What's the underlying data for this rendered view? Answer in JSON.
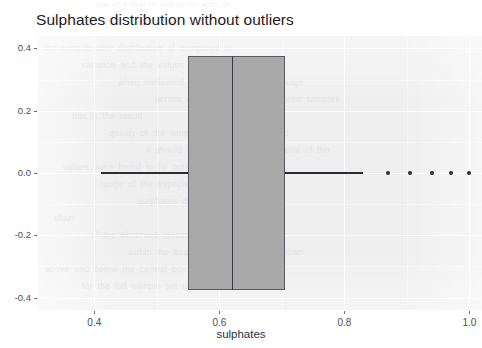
{
  "chart_data": {
    "type": "box",
    "orientation": "horizontal",
    "title": "Sulphates distribution without outliers",
    "xlabel": "sulphates",
    "ylabel": "",
    "xlim": [
      0.31,
      1.02
    ],
    "ylim": [
      -0.44,
      0.44
    ],
    "grid": true,
    "legend": "none",
    "xticks": [
      0.4,
      0.6,
      0.8,
      1.0
    ],
    "xtick_labels": [
      "0.4",
      "0.6",
      "0.8",
      "1.0"
    ],
    "yticks": [
      0.4,
      0.2,
      0.0,
      -0.2,
      -0.4
    ],
    "ytick_labels": [
      "0.4",
      "0.2",
      "0.0",
      "-0.2",
      "-0.4"
    ],
    "series": [
      {
        "name": "sulphates",
        "whisker_low": 0.41,
        "q1": 0.55,
        "median": 0.62,
        "q3": 0.705,
        "whisker_high": 0.83,
        "box_bottom": -0.375,
        "box_top": 0.375,
        "center": 0.0,
        "outliers": [
          0.87,
          0.905,
          0.94,
          0.97,
          1.0
        ]
      }
    ],
    "colors": {
      "panel_background": "#efefef",
      "grid": "#ffffff",
      "box_fill": "#a9a9a9",
      "box_border": "#59595f",
      "median": "#3a3a42",
      "whisker": "#2b2b33",
      "outlier": "#2b2b33",
      "text": "#1c1c1c",
      "tick_text": "#4e4e56"
    }
  },
  "artifacts": {
    "top_bleed_text": "the  of  a   that  in    and  to   for   with   on",
    "panel_bleed_lines": [
      "the considerable distribution of compared to",
      "variation  and  the  values  in  the  data  set",
      "when  calibrated  and  plotted  over  the  range",
      "across  a  number  of  the  measured  samples",
      "this  is  the  result",
      "quality  of  the  wine  values  were  compared",
      "it  should  also  be  noted  that  several  of  the",
      "values  were  found  to  lie  outside  the  normal",
      "range  of  the  expected  interquartile  spread",
      "Sulphates  distribution",
      "chart",
      "of  the  observed  measurements  remained",
      "within  the  bounds  of  the  whiskers  shown",
      "above  and  below  the  central  box  region",
      "for  the  full  sample  set  under  evaluation"
    ]
  }
}
